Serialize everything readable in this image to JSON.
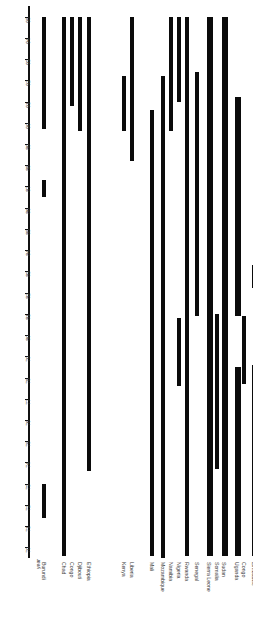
{
  "chart_data": {
    "type": "bar",
    "title": "",
    "subtitle": "",
    "xlabel": "",
    "ylabel": "year",
    "orientation": "vertical-floating-bars",
    "grid": false,
    "legend": null,
    "ylim": [
      69.5,
      95.5
    ],
    "y_ticks": [
      "95",
      "94",
      "93",
      "92",
      "91",
      "90",
      "89",
      "88",
      "87",
      "86",
      "85",
      "84",
      "83",
      "82",
      "81",
      "80",
      "79",
      "78",
      "77",
      "76",
      "75",
      "74",
      "73",
      "72",
      "71",
      "70"
    ],
    "y_axis_inverted": true,
    "categories": [
      "Burundi",
      "Chad",
      "Congo",
      "Djibouti",
      "Ethiopia",
      "Kenya",
      "Liberia",
      "Mali",
      "Mozambique",
      "Namibia",
      "Nigeria",
      "Rwanda",
      "Senegal",
      "Sierra Leone",
      "Somalia",
      "Sudan",
      "Uganda",
      "Congo",
      "Zimbabwe"
    ],
    "series": [
      {
        "name": "conflict-span",
        "bars": [
          {
            "category": "Burundi",
            "segments": [
              [
                95.0,
                89.7
              ],
              [
                87.3,
                86.5
              ],
              [
                73.0,
                71.4
              ]
            ]
          },
          {
            "category": "Chad",
            "segments": [
              [
                95.0,
                69.6
              ]
            ]
          },
          {
            "category": "Congo",
            "segments": [
              [
                95.0,
                90.8
              ]
            ]
          },
          {
            "category": "Djibouti",
            "segments": [
              [
                95.0,
                89.6
              ]
            ]
          },
          {
            "category": "Ethiopia",
            "segments": [
              [
                95.0,
                73.6
              ]
            ]
          },
          {
            "category": "Kenya",
            "segments": [
              [
                92.2,
                89.6
              ]
            ]
          },
          {
            "category": "Liberia",
            "segments": [
              [
                95.0,
                88.2
              ]
            ]
          },
          {
            "category": "Mali",
            "segments": [
              [
                90.6,
                69.6
              ]
            ]
          },
          {
            "category": "Mozambique",
            "segments": [
              [
                92.2,
                69.5
              ]
            ]
          },
          {
            "category": "Namibia",
            "segments": [
              [
                95.0,
                89.6
              ]
            ]
          },
          {
            "category": "Nigeria",
            "segments": [
              [
                95.0,
                91.0
              ],
              [
                80.8,
                77.6
              ]
            ]
          },
          {
            "category": "Rwanda",
            "segments": [
              [
                95.0,
                69.6
              ]
            ]
          },
          {
            "category": "Senegal",
            "segments": [
              [
                92.4,
                80.9
              ]
            ]
          },
          {
            "category": "Sierra Leone",
            "segments": [
              [
                95.0,
                91.6
              ],
              [
                91.6,
                69.6
              ]
            ]
          },
          {
            "category": "Somalia",
            "segments": [
              [
                81.0,
                73.7
              ]
            ]
          },
          {
            "category": "Sudan",
            "segments": [
              [
                95.0,
                80.9
              ],
              [
                80.9,
                69.6
              ]
            ]
          },
          {
            "category": "Uganda",
            "segments": [
              [
                91.2,
                80.9
              ],
              [
                78.5,
                69.6
              ]
            ]
          },
          {
            "category": "Congo",
            "segments": [
              [
                80.9,
                77.7
              ]
            ]
          },
          {
            "category": "Zimbabwe",
            "segments": [
              [
                83.3,
                82.2
              ],
              [
                78.6,
                69.6
              ]
            ]
          }
        ]
      }
    ]
  }
}
